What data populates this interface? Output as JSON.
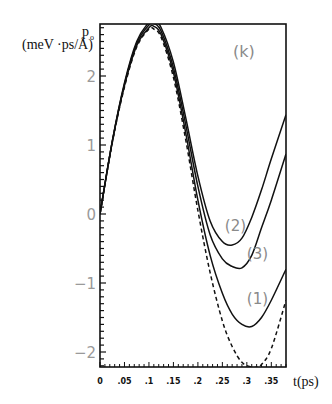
{
  "chart_data": {
    "type": "line",
    "panel_label": "(k)",
    "title": "",
    "xlabel": "t(ps)",
    "ylabel": "p_o (meV ·ps/Å)",
    "ylabel_top": "p",
    "ylabel_sub": "o",
    "ylabel_unit": "(meV ·ps/Å)",
    "xlim": [
      0,
      0.38
    ],
    "ylim": [
      -2.2,
      2.75
    ],
    "grid": false,
    "legend": "inline curve labels",
    "x_ticks": [
      0,
      0.05,
      0.1,
      0.15,
      0.2,
      0.25,
      0.3,
      0.35
    ],
    "x_tick_labels": [
      "0",
      ".05",
      ".1",
      ".15",
      ".2",
      ".25",
      ".3",
      ".35"
    ],
    "y_ticks": [
      -2,
      -1,
      0,
      1,
      2
    ],
    "y_tick_labels": [
      "-2",
      "-1",
      "0",
      "1",
      "2"
    ],
    "series": [
      {
        "name": "(2)",
        "style": "solid",
        "x": [
          0,
          0.025,
          0.05,
          0.075,
          0.1,
          0.11,
          0.125,
          0.15,
          0.175,
          0.2,
          0.225,
          0.25,
          0.27,
          0.29,
          0.31,
          0.33,
          0.35,
          0.38
        ],
        "values": [
          0,
          1.05,
          1.9,
          2.5,
          2.78,
          2.8,
          2.7,
          2.2,
          1.4,
          0.55,
          -0.1,
          -0.4,
          -0.45,
          -0.35,
          -0.05,
          0.35,
          0.8,
          1.44
        ]
      },
      {
        "name": "(3)",
        "style": "solid",
        "x": [
          0,
          0.025,
          0.05,
          0.075,
          0.1,
          0.11,
          0.125,
          0.15,
          0.175,
          0.2,
          0.225,
          0.25,
          0.27,
          0.29,
          0.31,
          0.33,
          0.35,
          0.38
        ],
        "values": [
          0,
          1.05,
          1.88,
          2.47,
          2.74,
          2.76,
          2.65,
          2.12,
          1.3,
          0.4,
          -0.3,
          -0.65,
          -0.76,
          -0.78,
          -0.6,
          -0.2,
          0.2,
          0.87
        ]
      },
      {
        "name": "(1)",
        "style": "solid",
        "x": [
          0,
          0.025,
          0.05,
          0.075,
          0.1,
          0.11,
          0.125,
          0.15,
          0.175,
          0.2,
          0.225,
          0.25,
          0.27,
          0.29,
          0.31,
          0.33,
          0.35,
          0.38
        ],
        "values": [
          0,
          1.04,
          1.86,
          2.44,
          2.7,
          2.72,
          2.6,
          2.05,
          1.18,
          0.2,
          -0.6,
          -1.15,
          -1.45,
          -1.6,
          -1.63,
          -1.5,
          -1.25,
          -0.8
        ]
      },
      {
        "name": "dashed",
        "style": "dashed",
        "x": [
          0,
          0.025,
          0.05,
          0.075,
          0.1,
          0.11,
          0.125,
          0.15,
          0.175,
          0.2,
          0.225,
          0.25,
          0.27,
          0.29,
          0.31,
          0.32,
          0.33,
          0.35,
          0.38
        ],
        "values": [
          0,
          1.03,
          1.84,
          2.42,
          2.68,
          2.68,
          2.56,
          1.98,
          1.08,
          0.05,
          -0.85,
          -1.55,
          -1.92,
          -2.15,
          -2.22,
          -2.22,
          -2.18,
          -1.95,
          -1.25
        ]
      }
    ],
    "curve_labels": [
      {
        "text": "(2)",
        "x": 0.255,
        "y": -0.25
      },
      {
        "text": "(3)",
        "x": 0.3,
        "y": -0.65
      },
      {
        "text": "(1)",
        "x": 0.3,
        "y": -1.3
      }
    ]
  }
}
